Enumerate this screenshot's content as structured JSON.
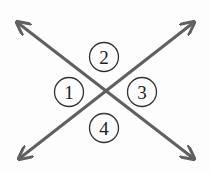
{
  "diagram": {
    "type": "intersecting-lines-angles",
    "colors": {
      "line": "#606060",
      "circle_stroke": "#333333",
      "text": "#222222",
      "background": "#fdfdfd"
    },
    "lines": [
      {
        "name": "line-a",
        "from": [
          18,
          23
        ],
        "to": [
          193,
          158
        ]
      },
      {
        "name": "line-b",
        "from": [
          20,
          158
        ],
        "to": [
          193,
          23
        ]
      }
    ],
    "intersection": [
      106,
      92
    ],
    "angle_labels": [
      {
        "label": "1",
        "cx": 69,
        "cy": 92
      },
      {
        "label": "2",
        "cx": 104,
        "cy": 57
      },
      {
        "label": "3",
        "cx": 142,
        "cy": 92
      },
      {
        "label": "4",
        "cx": 104,
        "cy": 128
      }
    ]
  }
}
